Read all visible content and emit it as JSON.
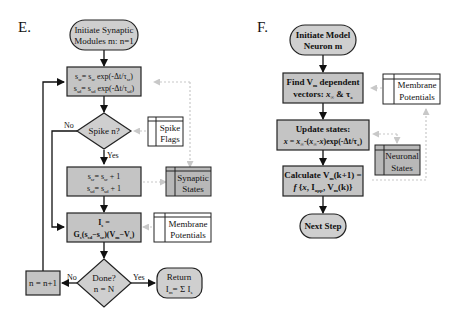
{
  "panels": [
    {
      "label": "E.",
      "nodes": {
        "start": [
          "Initiate Synaptic",
          "Modules m: n=1"
        ],
        "decay": [
          "s_sr = s_sr exp(-Δt/τ_sr)",
          "s_sd = s_sd exp(-Δt/τ_sd)"
        ],
        "spike_decision": "Spike n?",
        "increment": [
          "s_sr = s_sr + 1",
          "s_sd = s_sd + 1"
        ],
        "current": [
          "I_s =",
          "G_s(s_sd−s_sr)(V_m−V_s)"
        ],
        "done_decision": [
          "Done?",
          "n = N"
        ],
        "next_n": "n = n+1",
        "return": [
          "Return",
          "I_m = Σ I_s"
        ]
      },
      "stores": {
        "spike_flags": [
          "Spike",
          "Flags"
        ],
        "synaptic_states": [
          "Synaptic",
          "States"
        ],
        "membrane_potentials": [
          "Membrane",
          "Potentials"
        ]
      },
      "edge_labels": {
        "spike_no": "No",
        "spike_yes": "Yes",
        "done_no": "No",
        "done_yes": "Yes"
      }
    },
    {
      "label": "F.",
      "nodes": {
        "start": [
          "Initiate Model",
          "Neuron m"
        ],
        "find": [
          "Find V_m dependent",
          "vectors: x_∞ & τ_x"
        ],
        "update": [
          "Update states:",
          "x = x_∞-(x_∞-x)exp(-Δt/τ_x)"
        ],
        "calculate": [
          "Calculate V_m(k+1) =",
          "f {x, I_app, V_m(k)}"
        ],
        "next": "Next Step"
      },
      "stores": {
        "membrane_potentials": [
          "Membrane",
          "Potentials"
        ],
        "neuronal_states": [
          "Neuronal",
          "States"
        ]
      }
    }
  ]
}
